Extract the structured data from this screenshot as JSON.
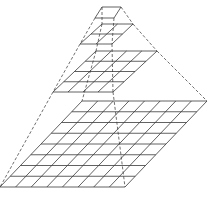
{
  "diagram": {
    "type": "image-pyramid",
    "stroke_color": "#3a3a3a",
    "dash_color": "#4a4a4a",
    "levels": [
      {
        "name": "level-1",
        "cells": 1,
        "tl": [
          102,
          7
        ],
        "tr": [
          121,
          7
        ],
        "br": [
          114,
          18
        ],
        "bl": [
          95,
          18
        ]
      },
      {
        "name": "level-2",
        "cells": 2,
        "tl": [
          102,
          24
        ],
        "tr": [
          133,
          24
        ],
        "br": [
          112,
          44
        ],
        "bl": [
          80,
          44
        ]
      },
      {
        "name": "level-3",
        "cells": 4,
        "tl": [
          96,
          51
        ],
        "tr": [
          157,
          51
        ],
        "br": [
          113,
          92
        ],
        "bl": [
          53,
          92
        ]
      },
      {
        "name": "level-4",
        "cells": 8,
        "tl": [
          82,
          101
        ],
        "tr": [
          207,
          101
        ],
        "br": [
          125,
          187
        ],
        "bl": [
          0,
          187
        ]
      }
    ]
  }
}
